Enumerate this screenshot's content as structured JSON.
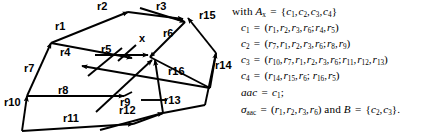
{
  "figure": {
    "type": "directed-graph-with-annotation",
    "graph": {
      "hub_node_label": "x",
      "edge_labels": [
        {
          "id": "r1",
          "text": "r1"
        },
        {
          "id": "r2",
          "text": "r2"
        },
        {
          "id": "r3",
          "text": "r3"
        },
        {
          "id": "r4",
          "text": "r4"
        },
        {
          "id": "r5",
          "text": "r5"
        },
        {
          "id": "r6",
          "text": "r6"
        },
        {
          "id": "r7",
          "text": "r7"
        },
        {
          "id": "r8",
          "text": "r8"
        },
        {
          "id": "r9",
          "text": "r9"
        },
        {
          "id": "r10",
          "text": "r10"
        },
        {
          "id": "r11",
          "text": "r11"
        },
        {
          "id": "r12",
          "text": "r12"
        },
        {
          "id": "r13",
          "text": "r13"
        },
        {
          "id": "r14",
          "text": "r14"
        },
        {
          "id": "r15",
          "text": "r15"
        },
        {
          "id": "r16",
          "text": "r16"
        }
      ]
    },
    "annotation": {
      "line1": {
        "prefix": "with",
        "symbol": "A",
        "symbol_sub": "x",
        "eq": "=",
        "set": "{c1, c2, c3, c4}",
        "members": [
          "c1",
          "c2",
          "c3",
          "c4"
        ]
      },
      "lines": [
        {
          "lhs": "c",
          "lhs_sub": "1",
          "pre": [
            "r1",
            "r2",
            "r3",
            "r6"
          ],
          "post": [
            "r4",
            "r5"
          ]
        },
        {
          "lhs": "c",
          "lhs_sub": "2",
          "pre": [
            "r7",
            "r1",
            "r2",
            "r3",
            "r6"
          ],
          "post": [
            "r8",
            "r9"
          ]
        },
        {
          "lhs": "c",
          "lhs_sub": "3",
          "pre": [
            "r10",
            "r7",
            "r1",
            "r2",
            "r3",
            "r6"
          ],
          "post": [
            "r11",
            "r12",
            "r13"
          ]
        },
        {
          "lhs": "c",
          "lhs_sub": "4",
          "pre": [
            "r14",
            "r15",
            "r6"
          ],
          "post": [
            "r16",
            "r5"
          ]
        }
      ],
      "aac_line": {
        "lhs": "aac",
        "eq": "=",
        "rhs": "c",
        "rhs_sub": "1",
        "terminator": ";"
      },
      "sigma_line": {
        "lhs": "σ",
        "lhs_sub": "aac",
        "eq": "=",
        "tuple": [
          "r1",
          "r2",
          "r3",
          "r6"
        ],
        "conj": "and",
        "bvar": "B",
        "eq2": "=",
        "bset": [
          "c2",
          "c3"
        ],
        "terminator": "."
      }
    }
  }
}
